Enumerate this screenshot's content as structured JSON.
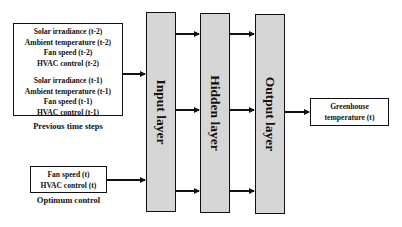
{
  "previous_box": {
    "group1": [
      "Solar irradiance (t-2)",
      "Ambient temperature (t-2)",
      "Fan speed (t-2)",
      "HVAC control (t-2)"
    ],
    "group2": [
      "Solar irradiance (t-1)",
      "Ambient temperature (t-1)",
      "Fan speed (t-1)",
      "HVAC control (t-1)"
    ],
    "caption": "Previous time steps"
  },
  "optimum_box": {
    "lines": [
      "Fan speed (t)",
      "HVAC control (t)"
    ],
    "caption": "Optimum control"
  },
  "layers": {
    "input": "Input layer",
    "hidden": "Hidden layer",
    "output": "Output layer"
  },
  "output_box": {
    "lines": [
      "Greenhouse",
      "temperature (t)"
    ]
  },
  "colors": {
    "layer_fill": "#d6d6d6",
    "stroke": "#111111"
  }
}
